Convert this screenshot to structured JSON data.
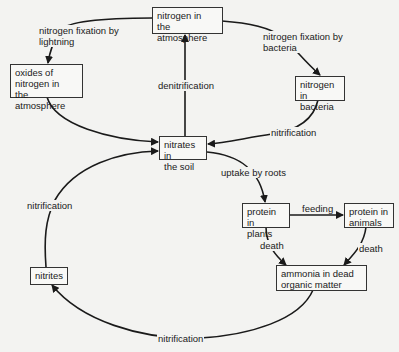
{
  "diagram": {
    "nodes": {
      "atmosphere": "nitrogen in\nthe atmosphere",
      "oxides": "oxides of\nnitrogen in\nthe atmosphere",
      "bacteria": "nitrogen in\nbacteria",
      "nitrates": "nitrates in\nthe soil",
      "plants": "protein in\nplants",
      "animals": "protein in\nanimals",
      "ammonia": "ammonia in dead\norganic matter",
      "nitrites": "nitrites"
    },
    "edges": {
      "lightning": "nitrogen fixation by\nlightning",
      "fix_bacteria": "nitrogen fixation by\nbacteria",
      "denitrification": "denitrification",
      "nitrification_bacteria": "nitrification",
      "uptake": "uptake by roots",
      "feeding": "feeding",
      "death_plants": "death",
      "death_animals": "death",
      "nitrification_nitrites": "nitrification",
      "nitrification_ammonia": "nitrification"
    }
  }
}
